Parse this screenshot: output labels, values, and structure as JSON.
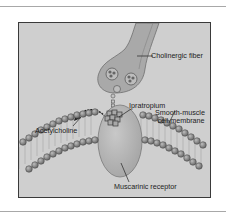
{
  "figure": {
    "labels": {
      "cholinergic_fiber": "Cholinergic fiber",
      "ipratropium": "Ipratropium",
      "acetylcholine": "Acetylcholine",
      "membrane_line1": "Smooth-muscle",
      "membrane_line2": "cell membrane",
      "muscarinic_receptor": "Muscarinic receptor"
    },
    "colors": {
      "background": "#cfcfcf",
      "frame_border": "#3a3a3a",
      "nerve_fill": "#a9a9a9",
      "nerve_inner": "#bdbdbd",
      "receptor_fill": "#b4b4b4",
      "lipid_head": "#7b7b7b"
    }
  }
}
